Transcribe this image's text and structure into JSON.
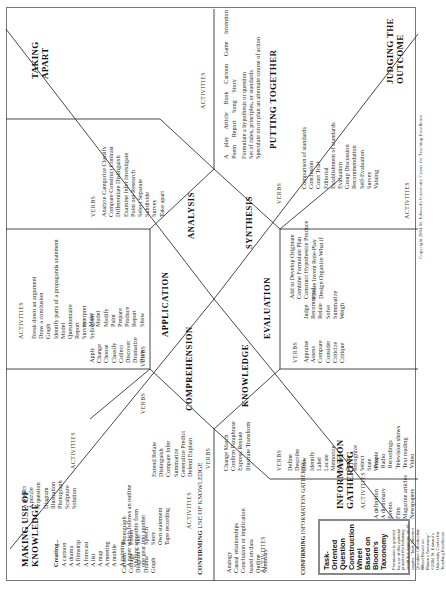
{
  "title": {
    "lines": [
      "Task-",
      "Oriented",
      "Question",
      "Construction",
      "Wheel",
      "Based on",
      "Bloom's",
      "Taxonomy"
    ],
    "permission": "Permission is granted for use of this material provided the following credit line appears on all copies: \"Task Oriented Question Construction Wheel Based on Bloom's Taxonomy.\" ©2004 St. Edward's University Center for Teaching Excellence."
  },
  "copyright": "Copyright 2004 St. Edward's University Center for Teaching Excellence",
  "labels": {
    "verbs": "VERBS",
    "activities": "ACTIVITIES"
  },
  "levels": {
    "knowledge": "KNOWLEDGE",
    "comprehension": "COMPREHENSION",
    "application": "APPLICATION",
    "analysis": "ANALYSIS",
    "synthesis": "SYNTHESIS",
    "evaluation": "EVALUATION"
  },
  "sections": {
    "information_gathering": {
      "title": [
        "INFORMATION",
        "GATHERING"
      ],
      "activities": [
        "A definition",
        "A dictionary",
        "Events",
        "Film",
        "Magazine articles",
        "Newspapers",
        "People",
        "Radio",
        "Recordings",
        "Television shows",
        "Text reading",
        "Video"
      ]
    },
    "confirming_info": {
      "header_bold": "CONFIRMING",
      "header_rest": " INFORMATION GATHERING",
      "activities": [
        "Analogy",
        "Causal relationships",
        "Conclusion or implication",
        "based on data",
        "Outline",
        "Summary"
      ]
    },
    "confirming_use": {
      "header_bold": "CONFIRMING",
      "header_rest": " USE OF KNOWLEDGE",
      "activities_col1": [
        "Cartoon",
        "Collage",
        "Diagram",
        "Drama",
        "Graph"
      ],
      "activities_col2": [
        "Photograph",
        "Poster",
        "Skit",
        "Speech",
        "Story",
        "Own statement",
        "Tape recording"
      ]
    },
    "making_use": {
      "title": [
        "MAKING USE OF",
        "KNOWLEDGE"
      ],
      "creating_label": "Creating...",
      "activities_col1": [
        "A cartoon",
        "A drama",
        "A filmstrip",
        "A forecast",
        "A list",
        "A map",
        "A meeting",
        "A mobile",
        "A painting",
        "A paper which follows an outline",
        "Shifting smoothly from",
        "one gear into another"
      ],
      "activities_col2": [
        "A project",
        "A puzzle",
        "A question",
        "Diagram",
        "Illustration",
        "Photograph",
        "Sculpture",
        "Solution"
      ]
    },
    "taking_apart": {
      "title": [
        "TAKING",
        "APART"
      ],
      "activities": [
        "Break down an argument",
        "Draw a conclusion",
        "Graph",
        "Identify parts of a propaganda statement",
        "Model",
        "Questionnaire",
        "Report",
        "Survey",
        "Syllogism"
      ]
    },
    "putting_together": {
      "title": "PUTTING TOGETHER",
      "activities_row1": [
        "A play",
        "Article",
        "Book",
        "Cartoon",
        "Game",
        "Invention"
      ],
      "activities_row2": [
        "Poem",
        "Report",
        "Song",
        "Story"
      ],
      "activities_lines": [
        "Formulate a hypothesis or question",
        "Set of rules, principles, or standards",
        "Speculate on or plan an alternate course of action"
      ]
    },
    "judging": {
      "title": [
        "JUDGING THE",
        "OUTCOME"
      ],
      "activities": [
        "Comparison of standards",
        "Conclusion",
        "Court Trial",
        "Editorial",
        "Establishment of standards",
        "Evaluation",
        "Group Discussion",
        "Recommendation",
        "Self-Evaluation",
        "Survey",
        "Valuing"
      ]
    }
  },
  "verbs": {
    "knowledge": [
      "Define",
      "Describe",
      "Draw",
      "Identify",
      "Label",
      "Locate",
      "Memorize",
      "Name",
      "Recite",
      "Recognize",
      "Select",
      "State",
      "Write"
    ],
    "comprehension": [
      "Change  Match",
      "Confirm  Paraphrase",
      "Express  Restate",
      "Illustrate  Transform"
    ],
    "comprehension_ext": [
      "Extend  Relate",
      "Distinguish",
      "Compare  Infer",
      "Summarize",
      "Generalize  Predict",
      "Defend  Explain"
    ],
    "application": [
      "Apply",
      "Change",
      "Choose",
      "Classify",
      "Collect",
      "Discover",
      "Dramatize",
      "Draw"
    ],
    "application_col2": [
      "Interpret",
      "Make",
      "Model",
      "Modify",
      "Paint",
      "Prepare",
      "Produce",
      "Report",
      "Show"
    ],
    "analysis": [
      "Analyze  Categorize  Classify",
      "Compare  Construct  Contrast",
      "Differentiate  Distinguish",
      "Examine  Infer  Investigate",
      "Point out  Research",
      "Select  Separate",
      "Subdivide",
      "Survey",
      "Take apart"
    ],
    "synthesis": [
      "Add to  Develop  Originate",
      "Combine  Formulate  Plan",
      "Construct  Hypothesize  Produce",
      "Create  Invent  Role-Play",
      "Design  Organize  What if"
    ],
    "evaluation": [
      "Appraise",
      "Assess",
      "Compare",
      "Consider",
      "Criticize",
      "Critique",
      "Judge",
      "Recommend",
      "Relate",
      "Solve",
      "Summarize",
      "Weigh"
    ]
  }
}
